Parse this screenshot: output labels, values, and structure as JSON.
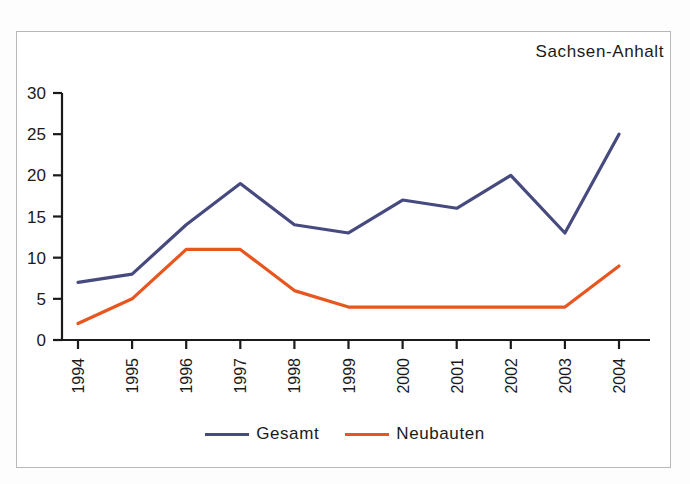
{
  "chart_data": {
    "type": "line",
    "title": "Sachsen-Anhalt",
    "xlabel": "",
    "ylabel": "",
    "categories": [
      "1994",
      "1995",
      "1996",
      "1997",
      "1998",
      "1999",
      "2000",
      "2001",
      "2002",
      "2003",
      "2004"
    ],
    "series": [
      {
        "name": "Gesamt",
        "color": "#464a7e",
        "values": [
          7,
          8,
          14,
          19,
          14,
          13,
          17,
          16,
          20,
          13,
          25
        ]
      },
      {
        "name": "Neubauten",
        "color": "#e8561f",
        "values": [
          2,
          5,
          11,
          11,
          6,
          4,
          4,
          4,
          4,
          4,
          9
        ]
      }
    ],
    "ylim": [
      0,
      30
    ],
    "yticks": [
      0,
      5,
      10,
      15,
      20,
      25,
      30
    ],
    "ytick_labels": [
      "0",
      "5",
      "10",
      "15",
      "20",
      "25",
      "30"
    ],
    "grid": false,
    "legend_position": "bottom",
    "xtick_rotation": -90
  },
  "legend": {
    "entries": [
      {
        "label": "Gesamt",
        "color": "#464a7e"
      },
      {
        "label": "Neubauten",
        "color": "#e8561f"
      }
    ]
  },
  "colors": {
    "gesamt": "#464a7e",
    "neubauten": "#e8561f",
    "axis": "#1a1a1a",
    "frame": "#b8b8b8",
    "background": "#ffffff"
  }
}
